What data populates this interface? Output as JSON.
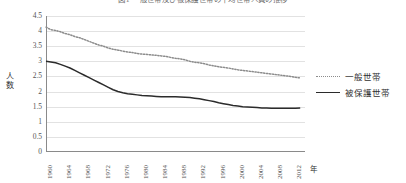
{
  "chart_data": {
    "type": "line",
    "title": "図1 一般世帯及び被保護世帯の平均世帯人員の推移",
    "xlabel": "年",
    "ylabel": "人数",
    "ylim": [
      0,
      4.5
    ],
    "ytick_step": 0.5,
    "grid": true,
    "legend_position": "right",
    "ytick_labels": [
      "4.5",
      "4",
      "3.5",
      "3",
      "2.5",
      "2",
      "1.5",
      "1",
      "0.5",
      "0"
    ],
    "ytick_values": [
      4.5,
      4,
      3.5,
      3,
      2.5,
      2,
      1.5,
      1,
      0.5,
      0
    ],
    "xtick_labels": [
      "1960",
      "1964",
      "1968",
      "1972",
      "1976",
      "1980",
      "1984",
      "1988",
      "1992",
      "1996",
      "2000",
      "2004",
      "2008",
      "2012"
    ],
    "xtick_values": [
      1960,
      1964,
      1968,
      1972,
      1976,
      1980,
      1984,
      1988,
      1992,
      1996,
      2000,
      2004,
      2008,
      2012
    ],
    "xlim": [
      1960,
      2014
    ],
    "x": [
      1960,
      1961,
      1962,
      1963,
      1964,
      1965,
      1966,
      1967,
      1968,
      1969,
      1970,
      1971,
      1972,
      1973,
      1974,
      1975,
      1976,
      1977,
      1978,
      1979,
      1980,
      1981,
      1982,
      1983,
      1984,
      1985,
      1986,
      1987,
      1988,
      1989,
      1990,
      1991,
      1992,
      1993,
      1994,
      1995,
      1996,
      1997,
      1998,
      1999,
      2000,
      2001,
      2002,
      2003,
      2004,
      2005,
      2006,
      2007,
      2008,
      2009,
      2010,
      2011,
      2012,
      2013
    ],
    "series": [
      {
        "name": "一般世帯",
        "style": "dotted",
        "color": "#8c8c8c",
        "values": [
          4.13,
          4.05,
          4.02,
          3.98,
          3.92,
          3.88,
          3.82,
          3.78,
          3.72,
          3.66,
          3.6,
          3.54,
          3.5,
          3.44,
          3.4,
          3.37,
          3.34,
          3.31,
          3.29,
          3.26,
          3.24,
          3.23,
          3.21,
          3.2,
          3.18,
          3.16,
          3.13,
          3.1,
          3.08,
          3.05,
          3.0,
          2.97,
          2.95,
          2.92,
          2.88,
          2.85,
          2.82,
          2.8,
          2.78,
          2.75,
          2.72,
          2.7,
          2.68,
          2.66,
          2.64,
          2.62,
          2.6,
          2.58,
          2.56,
          2.54,
          2.52,
          2.5,
          2.47,
          2.45
        ]
      },
      {
        "name": "被保護世帯",
        "style": "solid",
        "color": "#2b2b2b",
        "values": [
          3.0,
          2.98,
          2.95,
          2.9,
          2.84,
          2.78,
          2.7,
          2.62,
          2.54,
          2.46,
          2.38,
          2.3,
          2.22,
          2.14,
          2.06,
          2.0,
          1.96,
          1.93,
          1.91,
          1.89,
          1.87,
          1.86,
          1.85,
          1.84,
          1.83,
          1.83,
          1.83,
          1.83,
          1.82,
          1.81,
          1.8,
          1.78,
          1.76,
          1.73,
          1.7,
          1.67,
          1.63,
          1.6,
          1.57,
          1.54,
          1.52,
          1.5,
          1.49,
          1.48,
          1.47,
          1.46,
          1.46,
          1.45,
          1.45,
          1.45,
          1.45,
          1.45,
          1.45,
          1.46
        ]
      }
    ]
  },
  "legend": {
    "items": [
      {
        "label": "一般世帯"
      },
      {
        "label": "被保護世帯"
      }
    ]
  }
}
